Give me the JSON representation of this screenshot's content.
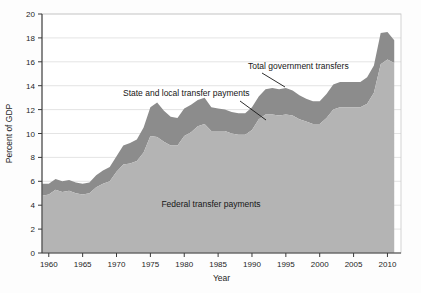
{
  "figure": {
    "background_color": "#fdfdfd"
  },
  "chart_data": {
    "type": "area",
    "stacked": true,
    "title": "",
    "xlabel": "Year",
    "ylabel": "Percent of GDP",
    "xlim": [
      1959,
      2012
    ],
    "ylim": [
      0,
      20
    ],
    "grid": true,
    "grid_axis": "y",
    "legend_position": "inline-annotations",
    "xticks": [
      1960,
      1965,
      1970,
      1975,
      1980,
      1985,
      1990,
      1995,
      2000,
      2005,
      2010
    ],
    "xtick_labels": [
      "1960",
      "1965",
      "1970",
      "1975",
      "1980",
      "1985",
      "1990",
      "1995",
      "2000",
      "2005",
      "2010"
    ],
    "yticks": [
      0,
      2,
      4,
      6,
      8,
      10,
      12,
      14,
      16,
      18,
      20
    ],
    "ytick_labels": [
      "0",
      "2",
      "4",
      "6",
      "8",
      "10",
      "12",
      "14",
      "16",
      "18",
      "20"
    ],
    "colors": {
      "federal": "#b4b4b4",
      "state_local": "#8c8c8c",
      "axis": "#3a3a3a",
      "grid": "#d8d8d8",
      "text": "#161616"
    },
    "x": [
      1959,
      1960,
      1961,
      1962,
      1963,
      1964,
      1965,
      1966,
      1967,
      1968,
      1969,
      1970,
      1971,
      1972,
      1973,
      1974,
      1975,
      1976,
      1977,
      1978,
      1979,
      1980,
      1981,
      1982,
      1983,
      1984,
      1985,
      1986,
      1987,
      1988,
      1989,
      1990,
      1991,
      1992,
      1993,
      1994,
      1995,
      1996,
      1997,
      1998,
      1999,
      2000,
      2001,
      2002,
      2003,
      2004,
      2005,
      2006,
      2007,
      2008,
      2009,
      2010,
      2011
    ],
    "series": [
      {
        "name": "Federal transfer payments",
        "color": "#b4b4b4",
        "values": [
          4.8,
          4.9,
          5.3,
          5.1,
          5.2,
          5.0,
          4.9,
          5.0,
          5.5,
          5.8,
          6.0,
          6.8,
          7.4,
          7.5,
          7.7,
          8.4,
          9.8,
          9.7,
          9.3,
          9.0,
          9.0,
          9.8,
          10.1,
          10.6,
          10.8,
          10.2,
          10.2,
          10.2,
          10.0,
          9.9,
          9.9,
          10.3,
          11.2,
          11.6,
          11.6,
          11.5,
          11.6,
          11.5,
          11.2,
          11.0,
          10.8,
          10.8,
          11.3,
          12.0,
          12.2,
          12.2,
          12.2,
          12.2,
          12.5,
          13.4,
          15.8,
          16.2,
          15.9
        ]
      },
      {
        "name": "State and local transfer payments",
        "color": "#8c8c8c",
        "values": [
          1.0,
          0.9,
          0.9,
          0.9,
          0.9,
          0.9,
          0.9,
          0.9,
          1.0,
          1.1,
          1.2,
          1.3,
          1.6,
          1.7,
          1.8,
          2.1,
          2.4,
          2.9,
          2.6,
          2.4,
          2.3,
          2.3,
          2.3,
          2.2,
          2.2,
          2.0,
          1.9,
          1.8,
          1.8,
          1.8,
          1.8,
          1.9,
          1.9,
          2.1,
          2.2,
          2.2,
          2.2,
          2.1,
          2.0,
          1.9,
          1.9,
          1.9,
          2.0,
          2.1,
          2.1,
          2.1,
          2.1,
          2.1,
          2.2,
          2.3,
          2.6,
          2.3,
          1.9
        ]
      }
    ],
    "total_label": "Total government transfers",
    "annotations": [
      {
        "text": "Total government transfers",
        "target_series": "Total government transfers"
      },
      {
        "text": "State and local transfer payments",
        "target_series": "State and local transfer payments"
      },
      {
        "text": "Federal transfer payments",
        "target_series": "Federal transfer payments"
      }
    ]
  }
}
